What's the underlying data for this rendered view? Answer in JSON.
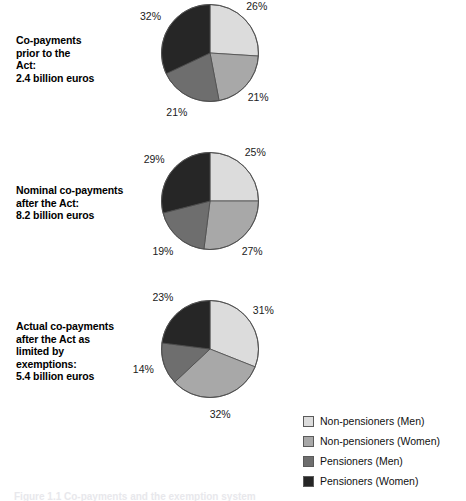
{
  "chart_data": [
    {
      "type": "pie",
      "title": "Co-payments prior to the Act: 2.4 billion euros",
      "caption": "Co-payments\nprior to the\nAct:\n2.4 billion euros",
      "categories": [
        "Non-pensioners (Men)",
        "Non-pensioners (Women)",
        "Pensioners (Men)",
        "Pensioners (Women)"
      ],
      "values": [
        26,
        21,
        21,
        32
      ],
      "labels": [
        "26%",
        "21%",
        "21%",
        "32%"
      ],
      "unit": "%",
      "total_label": "2.4 billion euros",
      "legend_position": "bottom-right",
      "start_angle": 0,
      "direction": "clockwise"
    },
    {
      "type": "pie",
      "title": "Nominal co-payments after the Act: 8.2 billion euros",
      "caption": "Nominal co-payments\nafter the Act:\n8.2 billion euros",
      "categories": [
        "Non-pensioners (Men)",
        "Non-pensioners (Women)",
        "Pensioners (Men)",
        "Pensioners (Women)"
      ],
      "values": [
        25,
        27,
        19,
        29
      ],
      "labels": [
        "25%",
        "27%",
        "19%",
        "29%"
      ],
      "unit": "%",
      "total_label": "8.2 billion euros",
      "legend_position": "bottom-right",
      "start_angle": 0,
      "direction": "clockwise"
    },
    {
      "type": "pie",
      "title": "Actual co-payments after the Act as limited by exemptions: 5.4 billion euros",
      "caption": "Actual co-payments\nafter the Act as\nlimited by\nexemptions:\n5.4 billion euros",
      "categories": [
        "Non-pensioners (Men)",
        "Non-pensioners (Women)",
        "Pensioners (Men)",
        "Pensioners (Women)"
      ],
      "values": [
        31,
        32,
        14,
        23
      ],
      "labels": [
        "31%",
        "32%",
        "14%",
        "23%"
      ],
      "unit": "%",
      "total_label": "5.4 billion euros",
      "legend_position": "bottom-right",
      "start_angle": 0,
      "direction": "clockwise"
    }
  ],
  "legend": {
    "items": [
      {
        "label": "Non-pensioners (Men)",
        "color": "#dcdcdc"
      },
      {
        "label": "Non-pensioners (Women)",
        "color": "#a8a8a8"
      },
      {
        "label": "Pensioners (Men)",
        "color": "#6e6e6e"
      },
      {
        "label": "Pensioners (Women)",
        "color": "#262626"
      }
    ]
  },
  "colors": {
    "slice_non_pensioners_men": "#dcdcdc",
    "slice_non_pensioners_women": "#a8a8a8",
    "slice_pensioners_men": "#6e6e6e",
    "slice_pensioners_women": "#262626",
    "slice_outline": "#4d4d4d",
    "text": "#000000",
    "background": "#ffffff"
  },
  "bottom_caption": "Figure 1.1 Co-payments and the exemption system"
}
